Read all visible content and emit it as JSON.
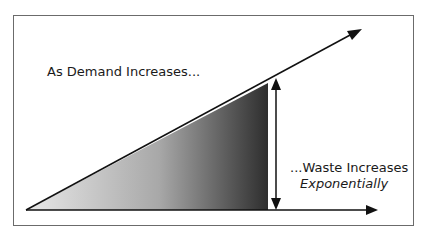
{
  "diagram": {
    "labels": {
      "demand": "As Demand Increases...",
      "waste_line1": "...Waste Increases",
      "waste_line2": "Exponentially"
    },
    "colors": {
      "frame": "#6b6b6b",
      "lines": "#111111",
      "gradient_start": "#e6e6e6",
      "gradient_end": "#2e2e2e"
    },
    "elements": [
      "demand-line-arrow",
      "baseline-arrow",
      "waste-gradient-triangle",
      "waste-vertical-double-arrow"
    ]
  }
}
